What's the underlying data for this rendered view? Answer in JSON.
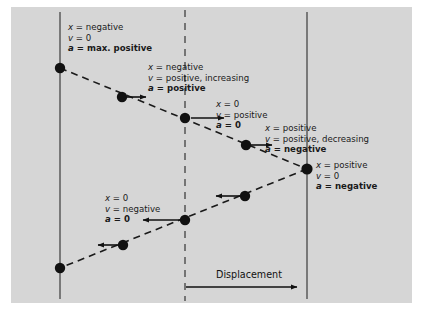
{
  "figure": {
    "background_color": "#d6d6d6",
    "page_background": "#ffffff",
    "line_color": "#4a4a4a",
    "dot_color": "#111111",
    "text_color": "#1a1a1a"
  },
  "axis": {
    "displacement_label": "Displacement"
  },
  "reference_lines": [
    {
      "name": "left-boundary",
      "style": "solid",
      "x": 60
    },
    {
      "name": "center-origin",
      "style": "dashed",
      "x": 185
    },
    {
      "name": "right-boundary",
      "style": "solid",
      "x": 307
    }
  ],
  "annotations": [
    {
      "id": "state-left-extreme",
      "x_line": "x = negative",
      "v_line": "v = 0",
      "a_line": "a = max. positive"
    },
    {
      "id": "state-moving-right-accelerating",
      "x_line": "x = negative",
      "v_line": "v = positive, increasing",
      "a_line": "a = positive"
    },
    {
      "id": "state-origin-max-speed-right",
      "x_line": "x = 0",
      "v_line": "v = positive",
      "a_line": "a = 0"
    },
    {
      "id": "state-moving-right-decelerating",
      "x_line": "x = positive",
      "v_line": "v = positive, decreasing",
      "a_line": "a = negative"
    },
    {
      "id": "state-right-extreme",
      "x_line": "x = positive",
      "v_line": "v = 0",
      "a_line": "a = negative"
    },
    {
      "id": "state-origin-max-speed-left",
      "x_line": "x = 0",
      "v_line": "v = negative",
      "a_line": "a = 0"
    }
  ],
  "positions": [
    {
      "id": "dot-left-extreme-top",
      "x": 60,
      "y": 68,
      "arrow": "none"
    },
    {
      "id": "dot-outbound-1",
      "x": 122,
      "y": 97,
      "arrow": "right"
    },
    {
      "id": "dot-origin-outbound",
      "x": 185,
      "y": 118,
      "arrow": "right"
    },
    {
      "id": "dot-outbound-2",
      "x": 246,
      "y": 145,
      "arrow": "right"
    },
    {
      "id": "dot-right-extreme",
      "x": 307,
      "y": 169,
      "arrow": "none"
    },
    {
      "id": "dot-return-1",
      "x": 245,
      "y": 196,
      "arrow": "left"
    },
    {
      "id": "dot-origin-return",
      "x": 185,
      "y": 220,
      "arrow": "left"
    },
    {
      "id": "dot-return-2",
      "x": 123,
      "y": 245,
      "arrow": "left"
    },
    {
      "id": "dot-left-extreme-bottom",
      "x": 60,
      "y": 268,
      "arrow": "none"
    }
  ]
}
